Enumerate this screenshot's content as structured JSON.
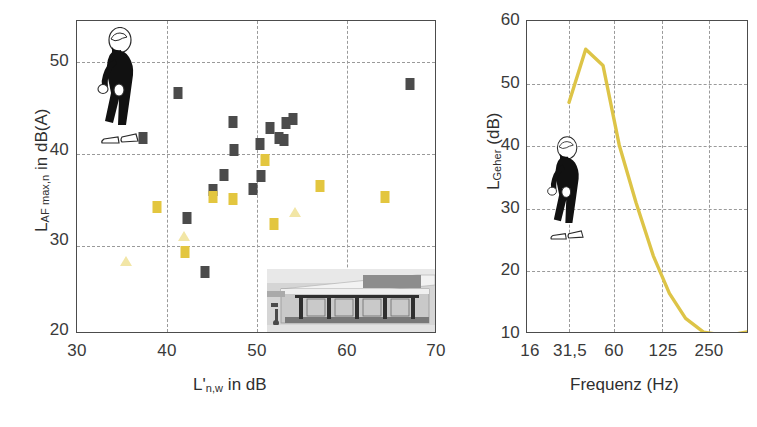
{
  "figure": {
    "background": "#ffffff",
    "colors": {
      "marker_dark": "#4b4b4b",
      "marker_gold": "#e3c63f",
      "marker_pale": "#f2e6a6",
      "curve": "#ddc447",
      "axis": "#4c4c4c",
      "grid": "#9a9a9a"
    },
    "pictogram_left": "walking-person-icon",
    "pictogram_right": "walking-person-icon",
    "photo_inset": "machine-photo"
  },
  "chart_data": [
    {
      "id": "scatter-panel",
      "type": "scatter",
      "title": "",
      "xlabel": "L'n,w in dB",
      "xlabel_main": "L'",
      "xlabel_sub": "n,w",
      "xlabel_tail": " in dB",
      "ylabel": "LAF max,n in dB(A)",
      "ylabel_main": "L",
      "ylabel_sub": "AF max,n",
      "ylabel_tail": " in dB(A)",
      "xlim": [
        30,
        70
      ],
      "ylim": [
        20,
        54
      ],
      "xticks": [
        30,
        40,
        50,
        60,
        70
      ],
      "xtick_labels": [
        "30",
        "40",
        "50",
        "60",
        "70"
      ],
      "yticks": [
        20,
        30,
        40,
        50
      ],
      "ytick_labels": [
        "20",
        "30",
        "40",
        "50"
      ],
      "grid": true,
      "gridlines_x": [
        40,
        50,
        60
      ],
      "gridlines_y": [
        30,
        40,
        50
      ],
      "legend": "none",
      "series": [
        {
          "name": "dark-squares",
          "color": "#4b4b4b",
          "marker": "square",
          "points": [
            [
              37.3,
              41.3
            ],
            [
              41.2,
              46.2
            ],
            [
              42.2,
              32.6
            ],
            [
              44.2,
              26.7
            ],
            [
              45.1,
              35.7
            ],
            [
              46.3,
              37.3
            ],
            [
              47.3,
              43.0
            ],
            [
              47.4,
              40.0
            ],
            [
              49.6,
              35.8
            ],
            [
              50.3,
              40.6
            ],
            [
              50.4,
              37.2
            ],
            [
              51.4,
              42.4
            ],
            [
              52.4,
              41.3
            ],
            [
              53.0,
              41.1
            ],
            [
              53.2,
              42.9
            ],
            [
              54.0,
              43.4
            ],
            [
              67.0,
              47.2
            ]
          ]
        },
        {
          "name": "gold-squares",
          "color": "#e3c63f",
          "marker": "square",
          "points": [
            [
              38.9,
              33.8
            ],
            [
              42.0,
              28.9
            ],
            [
              45.1,
              34.9
            ],
            [
              47.3,
              34.7
            ],
            [
              50.9,
              38.9
            ],
            [
              51.9,
              31.9
            ],
            [
              57.0,
              36.1
            ],
            [
              64.2,
              34.9
            ]
          ]
        },
        {
          "name": "pale-triangles",
          "color": "#f2e6a6",
          "marker": "triangle",
          "points": [
            [
              35.4,
              27.9
            ],
            [
              41.9,
              30.6
            ],
            [
              54.2,
              33.3
            ]
          ]
        }
      ]
    },
    {
      "id": "spectrum-panel",
      "type": "line",
      "title": "",
      "xlabel": "Frequenz (Hz)",
      "ylabel": "LGeher (dB)",
      "ylabel_main": "L",
      "ylabel_sub": "Geher",
      "ylabel_tail": " (dB)",
      "xscale": "log",
      "xlim": [
        14,
        300
      ],
      "ylim": [
        10,
        60
      ],
      "xticks": [
        16,
        31.5,
        60,
        125,
        250
      ],
      "xtick_labels": [
        "16",
        "31,5",
        "60",
        "125",
        "250"
      ],
      "yticks": [
        10,
        20,
        30,
        40,
        50,
        60
      ],
      "ytick_labels": [
        "10",
        "20",
        "30",
        "40",
        "50",
        "60"
      ],
      "grid": true,
      "gridlines_x": [
        31.5,
        60,
        125,
        250
      ],
      "gridlines_y": [
        20,
        30,
        40,
        50
      ],
      "legend": "none",
      "series": [
        {
          "name": "LGeher",
          "color": "#ddc447",
          "x": [
            25,
            31.5,
            40,
            50,
            63,
            80,
            100,
            125,
            160,
            200,
            250,
            300
          ],
          "y": [
            47.0,
            55.5,
            52.9,
            40.2,
            31.0,
            22.5,
            16.5,
            12.5,
            10.3,
            9.9,
            10.0,
            10.4
          ]
        }
      ]
    }
  ]
}
